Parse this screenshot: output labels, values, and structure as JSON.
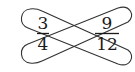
{
  "diagram": {
    "left_fraction": {
      "numerator": "3",
      "denominator": "4"
    },
    "right_fraction": {
      "numerator": "9",
      "denominator": "12"
    },
    "loops": [
      {
        "from": "3",
        "to": "12"
      },
      {
        "from": "4",
        "to": "9"
      }
    ],
    "colors": {
      "stroke": "#333333",
      "text": "#1a1a1a",
      "background": "#ffffff"
    }
  }
}
